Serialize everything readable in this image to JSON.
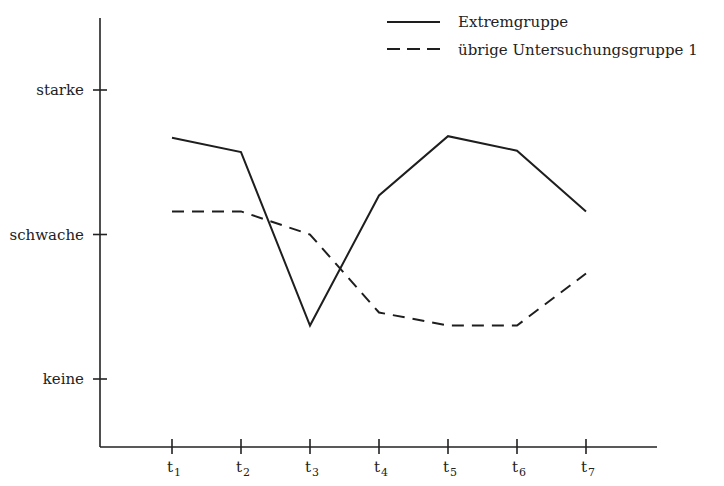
{
  "chart_data": {
    "type": "line",
    "title": "",
    "xlabel": "",
    "ylabel": "",
    "categories": [
      {
        "base": "t",
        "sub": "1"
      },
      {
        "base": "t",
        "sub": "2"
      },
      {
        "base": "t",
        "sub": "3"
      },
      {
        "base": "t",
        "sub": "4"
      },
      {
        "base": "t",
        "sub": "5"
      },
      {
        "base": "t",
        "sub": "6"
      },
      {
        "base": "t",
        "sub": "7"
      }
    ],
    "y_ticks": [
      {
        "value": 0,
        "label": "keine"
      },
      {
        "value": 1,
        "label": "schwache"
      },
      {
        "value": 2,
        "label": "starke"
      }
    ],
    "ylim": [
      -0.47,
      2.5
    ],
    "grid": false,
    "legend_position": "top-right",
    "series": [
      {
        "name": "Extremgruppe",
        "style": "solid",
        "values": [
          1.67,
          1.57,
          0.37,
          1.27,
          1.68,
          1.58,
          1.16
        ]
      },
      {
        "name": "übrige Untersuchungsgruppe 1",
        "style": "dashed",
        "values": [
          1.16,
          1.16,
          1.0,
          0.46,
          0.37,
          0.37,
          0.73
        ]
      }
    ]
  }
}
